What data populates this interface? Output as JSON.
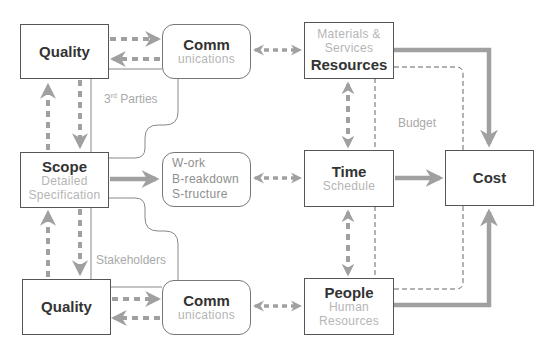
{
  "diagram": {
    "nodes": {
      "quality_top": {
        "title": "Quality"
      },
      "comm_top": {
        "title": "Comm",
        "subtitle": "unications"
      },
      "resources": {
        "pre1": "Materials &",
        "pre2": "Services",
        "title": "Resources"
      },
      "scope": {
        "title": "Scope",
        "sub1": "Detailed",
        "sub2": "Specification"
      },
      "wbs": {
        "line1": "W-ork",
        "line2": "B-reakdown",
        "line3": "S-tructure"
      },
      "time": {
        "title": "Time",
        "subtitle": "Schedule"
      },
      "cost": {
        "title": "Cost"
      },
      "quality_bottom": {
        "title": "Quality"
      },
      "comm_bottom": {
        "title": "Comm",
        "subtitle": "unications"
      },
      "people": {
        "title": "People",
        "sub1": "Human",
        "sub2": "Resources"
      }
    },
    "labels": {
      "third_parties_num": "3",
      "third_parties_sup": "rd",
      "third_parties_text": " Parties",
      "stakeholders": "Stakeholders",
      "budget": "Budget"
    },
    "colors": {
      "box_border": "#555555",
      "arrow_gray": "#a0a0a0",
      "muted_text": "#b5b5b5",
      "thin_line": "#888888"
    }
  }
}
